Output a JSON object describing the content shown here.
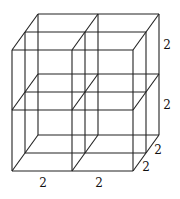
{
  "figure": {
    "grid": {
      "x_divisions": 2,
      "y_divisions": 2,
      "z_divisions": 2
    },
    "geometry": {
      "front_x": [
        12,
        72,
        133
      ],
      "front_y": [
        50,
        110,
        171
      ],
      "depth_dx": 13,
      "depth_dy": -18
    },
    "labels": [
      {
        "text": "2",
        "x": 167,
        "y": 49,
        "meaning": "height of top layer"
      },
      {
        "text": "2",
        "x": 167,
        "y": 109,
        "meaning": "height of bottom layer"
      },
      {
        "text": "2",
        "x": 158,
        "y": 154,
        "meaning": "depth of back layer"
      },
      {
        "text": "2",
        "x": 146,
        "y": 171,
        "meaning": "depth of front layer"
      },
      {
        "text": "2",
        "x": 43,
        "y": 187,
        "meaning": "width of left column"
      },
      {
        "text": "2",
        "x": 99,
        "y": 187,
        "meaning": "width of right column"
      }
    ]
  }
}
